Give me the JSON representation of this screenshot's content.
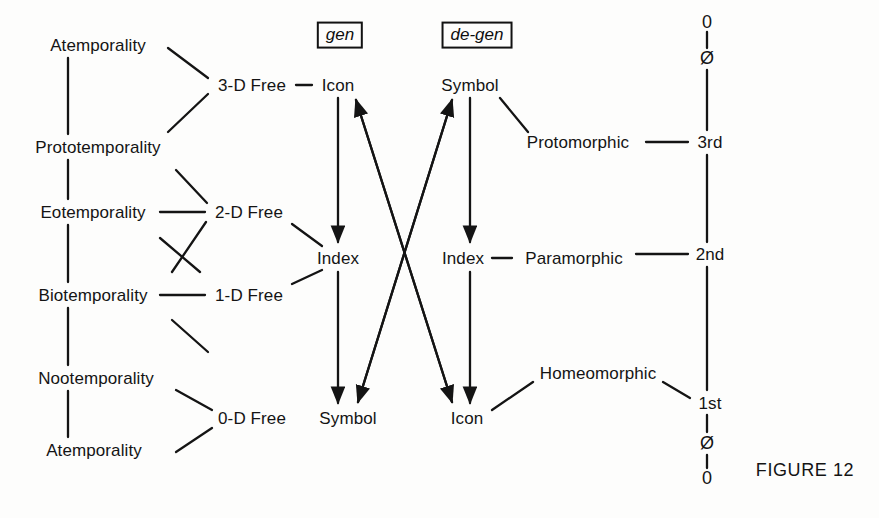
{
  "figure": {
    "caption": "FIGURE 12",
    "caption_x": 805,
    "caption_y": 470
  },
  "temporalities": {
    "title": "temporal levels",
    "x": 98,
    "items": [
      {
        "label": "Atemporality",
        "y": 45
      },
      {
        "label": "Prototemporality",
        "y": 147
      },
      {
        "label": "Eotemporality",
        "y": 212
      },
      {
        "label": "Biotemporality",
        "y": 295
      },
      {
        "label": "Nootemporality",
        "y": 378
      },
      {
        "label": "Atemporality",
        "y": 450
      }
    ]
  },
  "freedoms": {
    "x": 250,
    "items": [
      {
        "label": "3-D Free",
        "y": 85
      },
      {
        "label": "2-D Free",
        "y": 212
      },
      {
        "label": "1-D Free",
        "y": 295
      },
      {
        "label": "0-D Free",
        "y": 418
      }
    ]
  },
  "gen_column": {
    "box_label": "gen",
    "box_x": 340,
    "box_y": 35,
    "x": 340,
    "items": [
      {
        "label": "Icon",
        "y": 85
      },
      {
        "label": "Index",
        "y": 258
      },
      {
        "label": "Symbol",
        "y": 418
      }
    ]
  },
  "degen_column": {
    "box_label": "de-gen",
    "box_x": 472,
    "box_y": 35,
    "x": 462,
    "items": [
      {
        "label": "Symbol",
        "y": 85
      },
      {
        "label": "Index",
        "y": 258
      },
      {
        "label": "Icon",
        "y": 418
      }
    ]
  },
  "morphics": {
    "items": [
      {
        "label": "Protomorphic",
        "x": 578,
        "y": 142
      },
      {
        "label": "Paramorphic",
        "x": 572,
        "y": 258
      },
      {
        "label": "Homeomorphic",
        "x": 598,
        "y": 373
      }
    ]
  },
  "ordinal_axis": {
    "x": 707,
    "top_zero": {
      "label": "0",
      "y": 22
    },
    "top_slashed_zero": {
      "label": "Ø",
      "y": 58
    },
    "items": [
      {
        "label": "3rd",
        "y": 142
      },
      {
        "label": "2nd",
        "y": 254
      },
      {
        "label": "1st",
        "y": 403
      }
    ],
    "bottom_slashed_zero": {
      "label": "Ø",
      "y": 443
    },
    "bottom_zero": {
      "label": "0",
      "y": 478
    }
  },
  "colors": {
    "ink": "#141414",
    "background": "#fdfdfc"
  },
  "connections": {
    "note": "stem lines, diagonals and directed arrows between sign levels"
  }
}
